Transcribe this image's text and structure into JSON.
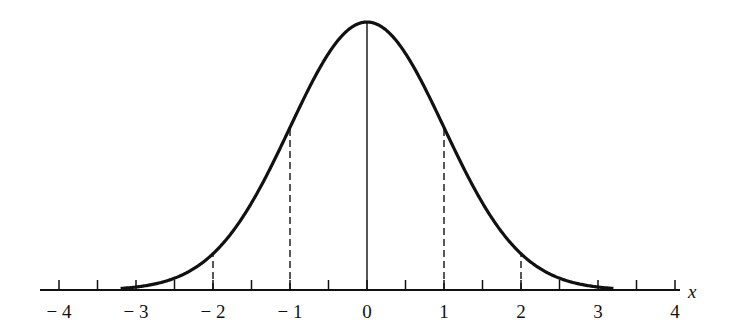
{
  "chart_data": {
    "type": "line",
    "title": "",
    "xlabel": "x",
    "ylabel": "",
    "xlim": [
      -4,
      4
    ],
    "x_ticks": [
      -4,
      -3.5,
      -3,
      -2.5,
      -2,
      -1.5,
      -1,
      -0.5,
      0,
      0.5,
      1,
      1.5,
      2,
      2.5,
      3,
      3.5,
      4
    ],
    "x_tick_labels": [
      "−4",
      "−3",
      "−2",
      "−1",
      "0",
      "1",
      "2",
      "3",
      "4"
    ],
    "x_tick_label_values": [
      -4,
      -3,
      -2,
      -1,
      0,
      1,
      2,
      3,
      4
    ],
    "curve": {
      "function": "standard normal pdf",
      "mean": 0,
      "sd": 1,
      "x_range": [
        -3.2,
        3.2
      ],
      "series": [
        {
          "x": -3,
          "y": 0.0044
        },
        {
          "x": -2,
          "y": 0.054
        },
        {
          "x": -1,
          "y": 0.242
        },
        {
          "x": 0,
          "y": 0.399
        },
        {
          "x": 1,
          "y": 0.242
        },
        {
          "x": 2,
          "y": 0.054
        },
        {
          "x": 3,
          "y": 0.0044
        }
      ]
    },
    "reference_lines": [
      {
        "x": 0,
        "style": "solid"
      },
      {
        "x": -1,
        "style": "dashed"
      },
      {
        "x": 1,
        "style": "dashed"
      },
      {
        "x": -2,
        "style": "dashed"
      },
      {
        "x": 2,
        "style": "dashed"
      }
    ],
    "grid": false,
    "legend": null
  },
  "layout": {
    "axis_y": 290,
    "center_x": 367,
    "px_per_unit": 77,
    "peak_height": 268,
    "tick_len": 10,
    "color": "#111111"
  }
}
